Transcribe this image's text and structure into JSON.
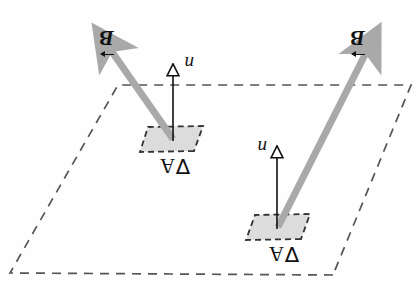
{
  "figure": {
    "kind": "physics-vector-diagram",
    "orientation": "page scanned upside-down (rotated 180 degrees)",
    "background_color": "#ffffff",
    "plane": {
      "name": "surface-plane",
      "style": "dashed parallelogram",
      "stroke_color": "#555555"
    },
    "patch_color": "#d9d9d9",
    "patch_stroke": "#333333",
    "field_arrow_color": "#a9a9a9",
    "normal_arrow_color": "#111111",
    "elements": [
      {
        "id": "element-1",
        "area_label": "∇A",
        "normal_label": "n",
        "field_label": "B"
      },
      {
        "id": "element-2",
        "area_label": "∇A",
        "normal_label": "n",
        "field_label": "B"
      }
    ]
  },
  "labels": {
    "area_1": "∇A",
    "area_2": "∇A",
    "normal_1": "n",
    "normal_2": "n",
    "field_1": "B",
    "field_2": "B"
  },
  "running_head": {
    "text_fragment": "CHAPTER 11  ·  Magnetic Flux",
    "note": "cropped running head at top edge of scanned page, partially cut off and upside-down"
  }
}
